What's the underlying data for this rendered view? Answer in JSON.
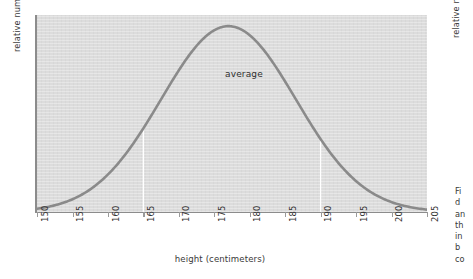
{
  "figure_main": {
    "ylabel": "relative number of people",
    "xlabel": "height (centimeters)",
    "annotation": "average"
  },
  "figure_right": {
    "ylabel": "relative number of people",
    "caption_lines": [
      "Fi",
      "d",
      "an",
      "th",
      "in",
      "b",
      "co"
    ]
  },
  "chart_data": {
    "type": "line",
    "title": "",
    "subtitle": "",
    "xlabel": "height (centimeters)",
    "ylabel": "relative number of people",
    "xlim": [
      150,
      205
    ],
    "ylim": [
      0,
      1.06
    ],
    "xticks": [
      150,
      155,
      160,
      165,
      170,
      175,
      180,
      185,
      190,
      195,
      200,
      205
    ],
    "xticklabels": [
      "150",
      "155",
      "160",
      "165",
      "170",
      "175",
      "180",
      "185",
      "190",
      "195",
      "200",
      "205"
    ],
    "yticks": [],
    "yticklabels": [],
    "grid": false,
    "legend": null,
    "plot_background": "#dcdcdc",
    "curve_color": "#8a8a8a",
    "marker_color": "#ffffff",
    "distribution": {
      "kind": "normal",
      "mean": 177,
      "std": 9.5,
      "peak_x": 177,
      "peak_y": 1.0
    },
    "annotations": [
      {
        "text": "average",
        "x": 177,
        "y": 0.78
      }
    ],
    "markers": [
      {
        "x": 165,
        "type": "vertical-line",
        "color": "#ffffff"
      },
      {
        "x": 190,
        "type": "vertical-line",
        "color": "#ffffff"
      }
    ],
    "x": [
      150,
      152,
      154,
      156,
      158,
      160,
      162,
      164,
      166,
      168,
      170,
      172,
      174,
      176,
      177,
      178,
      180,
      182,
      184,
      186,
      188,
      190,
      192,
      194,
      196,
      198,
      200,
      202,
      205
    ],
    "y": [
      0.01,
      0.018,
      0.03,
      0.049,
      0.077,
      0.115,
      0.166,
      0.23,
      0.307,
      0.394,
      0.487,
      0.58,
      0.667,
      0.741,
      0.77,
      0.795,
      0.835,
      0.852,
      0.843,
      0.809,
      0.752,
      0.677,
      0.59,
      0.498,
      0.407,
      0.322,
      0.246,
      0.182,
      0.106
    ]
  }
}
